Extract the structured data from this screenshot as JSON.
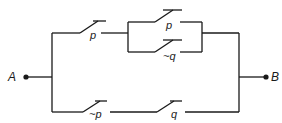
{
  "diagram": {
    "type": "switching-circuit",
    "terminals": {
      "left": "A",
      "right": "B"
    },
    "switches": {
      "top_p": "p",
      "inner_p": "p",
      "inner_not_q": "~q",
      "bottom_not_p": "~p",
      "bottom_q": "q"
    },
    "structure": "A — [ p · ( p + ~q ) ] + [ ~p · q ] — B",
    "colors": {
      "line": "#1a1a1a",
      "background": "#ffffff"
    }
  }
}
